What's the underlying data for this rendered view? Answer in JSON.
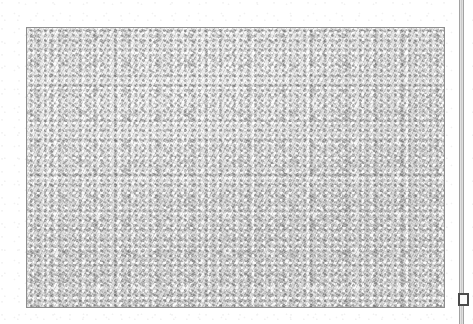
{
  "document": {
    "kind": "scanned-page",
    "page_background": "#ffffff",
    "width": 473,
    "height": 324
  },
  "image_block": {
    "label": "",
    "caption": "",
    "border_color": "#8d8d8d",
    "fill_color": "#dcdcdc",
    "texture": "uniform-gray-noise",
    "x": 26,
    "y": 27,
    "width": 419,
    "height": 281
  },
  "right_margin": {
    "edge_rule_color": "#a2a2a2",
    "band_color": "#c9c9c9",
    "corner_marker": {
      "label": "",
      "border_color": "#4a4a4a",
      "fill_color": "#fafafa"
    }
  }
}
